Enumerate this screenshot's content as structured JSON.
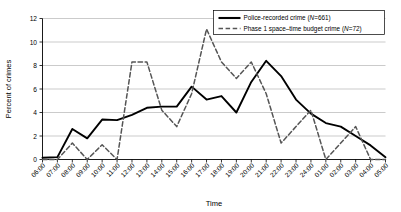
{
  "chart_data": {
    "type": "line",
    "title": "",
    "xlabel": "Time",
    "ylabel": "Percent of crimes",
    "ylim": [
      0,
      12
    ],
    "ytick_step": 2,
    "yticks": [
      0,
      2,
      4,
      6,
      8,
      10,
      12
    ],
    "grid": true,
    "grid_axis": "y",
    "legend_position": "top-right",
    "categories": [
      "06:00",
      "07:00",
      "08:00",
      "09:00",
      "10:00",
      "11:00",
      "12:00",
      "13:00",
      "14:00",
      "15:00",
      "16:00",
      "17:00",
      "18:00",
      "19:00",
      "20:00",
      "21:00",
      "22:00",
      "23:00",
      "24:00",
      "01:00",
      "02:00",
      "03:00",
      "04:00",
      "05:00"
    ],
    "series": [
      {
        "name": "Police-recorded crime (N=661)",
        "style": "solid",
        "color": "#000000",
        "values": [
          0.15,
          0.2,
          2.6,
          1.8,
          3.4,
          3.35,
          3.8,
          4.4,
          4.5,
          4.5,
          6.2,
          5.1,
          5.4,
          4.0,
          6.6,
          8.4,
          7.1,
          5.1,
          3.9,
          3.1,
          2.8,
          2.0,
          1.2,
          0.2
        ]
      },
      {
        "name": "Phase 1 space-time budget crime (N=72)",
        "style": "dashed",
        "color": "#555555",
        "values": [
          0.0,
          0.0,
          1.4,
          0.0,
          1.25,
          0.0,
          8.3,
          8.3,
          4.2,
          2.8,
          5.6,
          11.1,
          8.3,
          6.9,
          8.3,
          5.6,
          1.4,
          2.8,
          4.2,
          0.0,
          1.4,
          2.8,
          0.0,
          0.0
        ]
      }
    ]
  },
  "legend": {
    "entries": [
      {
        "label_main": "Police-recorded crime (",
        "label_ital": "N",
        "label_tail": "=661)",
        "style": "solid"
      },
      {
        "label_main": "Phase 1 space–time budget crime (",
        "label_ital": "N",
        "label_tail": "=72)",
        "style": "dashed"
      }
    ]
  },
  "axes": {
    "y_title": "Percent of crimes",
    "x_title": "Time"
  }
}
